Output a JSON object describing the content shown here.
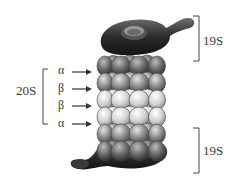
{
  "diagram": {
    "labels": {
      "core": "20S",
      "cap_top": "19S",
      "cap_bottom": "19S"
    },
    "rings": [
      {
        "label": "α",
        "type": "alpha"
      },
      {
        "label": "β",
        "type": "beta"
      },
      {
        "label": "β",
        "type": "beta"
      },
      {
        "label": "α",
        "type": "alpha"
      }
    ],
    "colors": {
      "cap": "#2b2b2b",
      "alpha_ring": "#8a8a8a",
      "beta_ring": "#d6d6d6",
      "text": "#3a3a3a",
      "line": "#444444"
    }
  }
}
